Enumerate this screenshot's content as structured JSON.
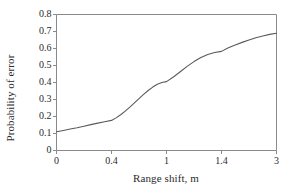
{
  "chart_data": {
    "type": "line",
    "title": "",
    "xlabel": "Range shift, m",
    "ylabel": "Probability of error",
    "x_tick_labels": [
      "0",
      "0.4",
      "1",
      "1.4",
      "3"
    ],
    "x_tick_values": [
      0,
      0.4,
      1,
      1.4,
      3
    ],
    "y_tick_labels": [
      "0",
      "0.1",
      "0.2",
      "0.3",
      "0.4",
      "0.5",
      "0.6",
      "0.7",
      "0.8"
    ],
    "y_tick_values": [
      0,
      0.1,
      0.2,
      0.3,
      0.4,
      0.5,
      0.6,
      0.7,
      0.8
    ],
    "ylim": [
      0,
      0.8
    ],
    "grid": false,
    "legend": false,
    "axis_note": "x axis ticks are evenly spaced by category position, not linear in value",
    "series": [
      {
        "name": "Probability of error",
        "x_labels": [
          "0",
          "0.4",
          "1",
          "1.4",
          "3"
        ],
        "values_at_ticks": [
          0.11,
          0.175,
          0.4,
          0.58,
          0.69
        ],
        "points": [
          [
            0.0,
            0.11
          ],
          [
            0.05,
            0.118
          ],
          [
            0.1,
            0.126
          ],
          [
            0.15,
            0.134
          ],
          [
            0.2,
            0.143
          ],
          [
            0.25,
            0.152
          ],
          [
            0.3,
            0.161
          ],
          [
            0.35,
            0.169
          ],
          [
            0.4,
            0.177
          ],
          [
            0.45,
            0.192
          ],
          [
            0.5,
            0.21
          ],
          [
            0.55,
            0.232
          ],
          [
            0.6,
            0.255
          ],
          [
            0.65,
            0.28
          ],
          [
            0.7,
            0.305
          ],
          [
            0.75,
            0.33
          ],
          [
            0.8,
            0.353
          ],
          [
            0.85,
            0.373
          ],
          [
            0.9,
            0.39
          ],
          [
            0.95,
            0.4
          ],
          [
            1.0,
            0.405
          ],
          [
            1.05,
            0.432
          ],
          [
            1.1,
            0.463
          ],
          [
            1.15,
            0.495
          ],
          [
            1.2,
            0.523
          ],
          [
            1.25,
            0.547
          ],
          [
            1.3,
            0.565
          ],
          [
            1.35,
            0.576
          ],
          [
            1.4,
            0.583
          ],
          [
            1.6,
            0.605
          ],
          [
            1.8,
            0.621
          ],
          [
            2.0,
            0.636
          ],
          [
            2.2,
            0.65
          ],
          [
            2.4,
            0.663
          ],
          [
            2.6,
            0.673
          ],
          [
            2.8,
            0.683
          ],
          [
            3.0,
            0.69
          ]
        ]
      }
    ]
  },
  "style": {
    "line_color": "#5a5a5a",
    "axis_color": "#8a8a8a",
    "text_color": "#2b2b2b",
    "background": "#ffffff"
  }
}
